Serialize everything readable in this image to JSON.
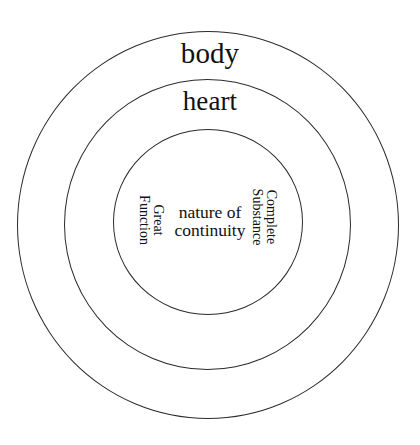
{
  "diagram": {
    "type": "concentric-circles",
    "title": "",
    "background_color": "#ffffff",
    "stroke_color": "#2b2b2b",
    "text_color": "#111111",
    "rings": [
      {
        "id": "outer",
        "label": "body",
        "level": 1,
        "radius_px": 191,
        "label_position": "top-inside",
        "label_rotation_deg": 0
      },
      {
        "id": "middle",
        "label": "heart",
        "level": 2,
        "radius_px": 144,
        "label_position": "top-inside",
        "label_rotation_deg": 0
      },
      {
        "id": "inner",
        "label": "",
        "level": 3,
        "radius_px": 95,
        "label_position": "center",
        "label_rotation_deg": 0
      }
    ],
    "center_labels": {
      "core": "nature of\ncontinuity",
      "left": "Great\nFunction",
      "right": "Complete\nSubstance"
    },
    "center_label_rotations": {
      "core_deg": 0,
      "left_deg": 90,
      "right_deg": 90
    }
  }
}
